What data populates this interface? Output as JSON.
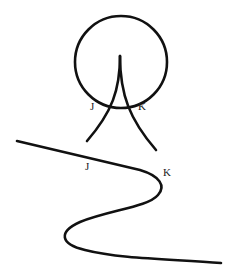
{
  "figure": {
    "top_diagram": {
      "description": "Circle with two curves forming a cusp inside; curves cross the circle at J and K",
      "labels": {
        "j": "J",
        "k": "K"
      }
    },
    "bottom_diagram": {
      "description": "S-shaped curve with points J and K marked along it",
      "labels": {
        "j": "J",
        "k": "K"
      }
    }
  },
  "colors": {
    "stroke": "#111111",
    "background": "#ffffff"
  }
}
